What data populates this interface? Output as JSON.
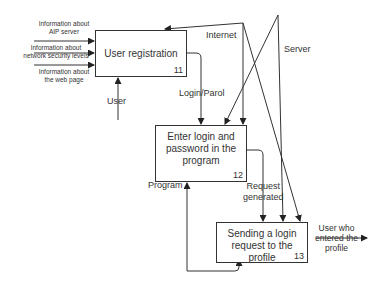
{
  "diagram": {
    "type": "IDEF0",
    "boxes": [
      {
        "id": "11",
        "title": "User registration",
        "number": "11"
      },
      {
        "id": "12",
        "title_lines": [
          "Enter login and",
          "password in the",
          "program"
        ],
        "number": "12"
      },
      {
        "id": "13",
        "title_lines": [
          "Sending a login",
          "request to the profile"
        ],
        "number": "13"
      }
    ],
    "inputs": [
      {
        "lines": [
          "Information about",
          "AIP server"
        ]
      },
      {
        "lines": [
          "Information about",
          "network security levels"
        ]
      },
      {
        "lines": [
          "Information about",
          "the web page"
        ]
      }
    ],
    "arrows": {
      "user": "User",
      "internet": "Internet",
      "server": "Server",
      "login_parol": "Login/Parol",
      "program": "Program",
      "request_generated": [
        "Request",
        "generated"
      ],
      "output": [
        "User who",
        "entered the",
        "profile"
      ]
    }
  }
}
